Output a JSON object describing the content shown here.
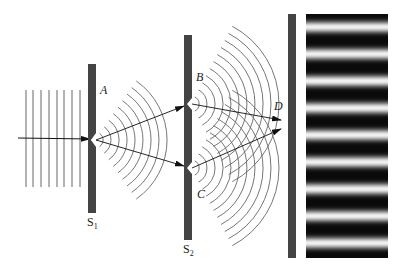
{
  "labels": {
    "A": "A",
    "B": "B",
    "C": "C",
    "D": "D",
    "S1": "S",
    "S1_sub": "1",
    "S2": "S",
    "S2_sub": "2"
  },
  "colors": {
    "barrier": "#444444",
    "wave_line": "#666666",
    "arrow": "#111111",
    "fringe_dark": "#0a0a0a",
    "fringe_bright": "#f2f2f2"
  },
  "geometry": {
    "plane_wave_x": [
      26,
      33,
      41,
      49,
      57,
      64,
      72,
      80
    ],
    "slit_A": [
      95,
      140
    ],
    "slit_B": [
      191,
      104
    ],
    "slit_C": [
      191,
      168
    ],
    "arcs_A_radii": [
      8,
      16,
      24,
      32,
      40,
      48,
      56,
      64,
      72
    ],
    "arcs_B_radii": [
      8,
      16,
      24,
      32,
      40,
      48,
      56,
      64,
      72,
      80,
      88
    ],
    "arcs_C_radii": [
      8,
      16,
      24,
      32,
      40,
      48,
      56,
      64,
      72,
      80,
      88
    ],
    "fringe_period_px": 27,
    "fringe_count": 9
  }
}
